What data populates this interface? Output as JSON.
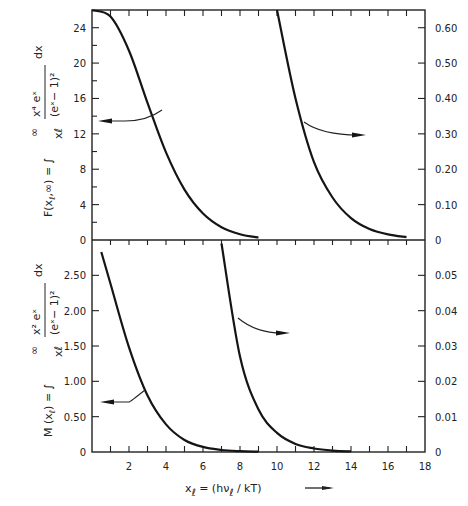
{
  "chart_data": [
    {
      "type": "line",
      "panel": "top",
      "ylabel_left": "F(x_l,∞) = ∫_{x_l}^{∞} x⁴eˣ/(eˣ−1)² dx",
      "ylabel_parts": {
        "lhs": "F(x",
        "sub": "ℓ",
        "rhs": ",∞) = ∫",
        "numer": "x⁴ eˣ",
        "denom": "(eˣ− 1)²",
        "dx": "dx",
        "lower": "xℓ",
        "upper": "∞"
      },
      "xlim": [
        0,
        18
      ],
      "ylim_left": [
        0,
        26
      ],
      "ylim_right": [
        0,
        0.65
      ],
      "yticks_left": [
        "0",
        "4",
        "8",
        "12",
        "16",
        "20",
        "24"
      ],
      "yticks_left_values": [
        0,
        4,
        8,
        12,
        16,
        20,
        24
      ],
      "yticks_right": [
        "0",
        "0.10",
        "0.20",
        "0.30",
        "0.40",
        "0.50",
        "0.60"
      ],
      "yticks_right_values": [
        0,
        0.1,
        0.2,
        0.3,
        0.4,
        0.5,
        0.6
      ],
      "series": [
        {
          "name": "F (left scale)",
          "axis": "left",
          "x_range": [
            0,
            9
          ],
          "points": [
            [
              0,
              25.98
            ],
            [
              1,
              25.25
            ],
            [
              2,
              21.4
            ],
            [
              3,
              15.5
            ],
            [
              4,
              9.9
            ],
            [
              5,
              5.7
            ],
            [
              6,
              3.0
            ],
            [
              7,
              1.45
            ],
            [
              8,
              0.66
            ],
            [
              9,
              0.28
            ]
          ],
          "indicator": "arrow-left"
        },
        {
          "name": "F (right scale)",
          "axis": "right",
          "x_range": [
            10,
            17
          ],
          "points": [
            [
              10,
              0.7
            ],
            [
              11,
              0.4
            ],
            [
              12,
              0.22
            ],
            [
              13,
              0.12
            ],
            [
              14,
              0.062
            ],
            [
              15,
              0.031
            ],
            [
              16,
              0.016
            ],
            [
              17,
              0.008
            ]
          ],
          "indicator": "arrow-right"
        }
      ]
    },
    {
      "type": "line",
      "panel": "bottom",
      "ylabel_left": "M(x_l) = ∫_{x_l}^{∞} x²eˣ/(eˣ−1)² dx",
      "ylabel_parts": {
        "lhs": "M (x",
        "sub": "ℓ",
        "rhs": ") = ∫",
        "numer": "x² eˣ",
        "denom": "(eˣ− 1)²",
        "dx": "dx",
        "lower": "xℓ",
        "upper": "∞"
      },
      "xlim": [
        0,
        18
      ],
      "ylim_left": [
        0,
        3.0
      ],
      "ylim_right": [
        0,
        0.06
      ],
      "yticks_left": [
        "0",
        "0.50",
        "1.00",
        "1.50",
        "2.00",
        "2.50"
      ],
      "yticks_left_values": [
        0,
        0.5,
        1.0,
        1.5,
        2.0,
        2.5
      ],
      "yticks_right": [
        "0",
        "0.01",
        "0.02",
        "0.03",
        "0.04",
        "0.05"
      ],
      "yticks_right_values": [
        0,
        0.01,
        0.02,
        0.03,
        0.04,
        0.05
      ],
      "series": [
        {
          "name": "M (left scale)",
          "axis": "left",
          "x_range": [
            0.45,
            9
          ],
          "points": [
            [
              0.5,
              2.83
            ],
            [
              1,
              2.38
            ],
            [
              2,
              1.48
            ],
            [
              3,
              0.8
            ],
            [
              4,
              0.39
            ],
            [
              5,
              0.17
            ],
            [
              6,
              0.072
            ],
            [
              7,
              0.029
            ],
            [
              8,
              0.011
            ],
            [
              9,
              0.004
            ]
          ],
          "indicator": "arrow-left"
        },
        {
          "name": "M (right scale)",
          "axis": "right",
          "x_range": [
            7,
            14
          ],
          "points": [
            [
              7,
              0.059
            ],
            [
              8,
              0.027
            ],
            [
              9,
              0.012
            ],
            [
              10,
              0.0054
            ],
            [
              11,
              0.0023
            ],
            [
              12,
              0.001
            ],
            [
              13,
              0.0004
            ],
            [
              14,
              0.00017
            ]
          ],
          "indicator": "arrow-right"
        }
      ]
    }
  ],
  "x_axis": {
    "ticks": [
      "2",
      "4",
      "6",
      "8",
      "10",
      "12",
      "14",
      "16",
      "18"
    ],
    "tick_values": [
      2,
      4,
      6,
      8,
      10,
      12,
      14,
      16,
      18
    ],
    "minor_step": 1,
    "label": "x_l = (hν_l / kT) →",
    "label_parts": {
      "x": "x",
      "sub": "ℓ",
      "eq": " = (hν",
      "sub2": "ℓ",
      "tail": " / kT)",
      "arrow": "⟶"
    }
  }
}
